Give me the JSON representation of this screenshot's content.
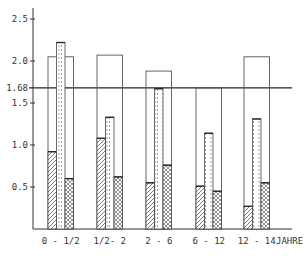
{
  "chart_data": {
    "type": "bar",
    "title": "",
    "xlabel": "JAHRE",
    "ylabel": "",
    "ylim": [
      0,
      2.6
    ],
    "yticks": [
      0.5,
      1.0,
      1.5,
      1.68,
      2.0,
      2.5
    ],
    "ytick_labels": [
      "0.5",
      "1.0",
      "1.5",
      "1.68",
      "2.0",
      "2.5"
    ],
    "reference_line": {
      "value": 1.68,
      "label": "1.68"
    },
    "grid": false,
    "legend": [],
    "categories": [
      "0 - 1/2",
      "1/2- 2",
      "2 - 6",
      "6 - 12",
      "12 - 14"
    ],
    "series": [
      {
        "name": "outline (total)",
        "pattern": "open",
        "values": [
          2.05,
          2.07,
          1.88,
          1.68,
          2.05
        ]
      },
      {
        "name": "hatched",
        "pattern": "diagonal-hatch",
        "values": [
          0.92,
          1.08,
          0.55,
          0.51,
          0.27
        ]
      },
      {
        "name": "dotted",
        "pattern": "dotted",
        "values": [
          2.22,
          1.33,
          1.67,
          1.14,
          1.31
        ]
      },
      {
        "name": "cross-hatched",
        "pattern": "x-hatch",
        "values": [
          0.6,
          0.62,
          0.76,
          0.45,
          0.55
        ]
      }
    ]
  },
  "axis": {
    "x_unit_label": "JAHRE"
  }
}
